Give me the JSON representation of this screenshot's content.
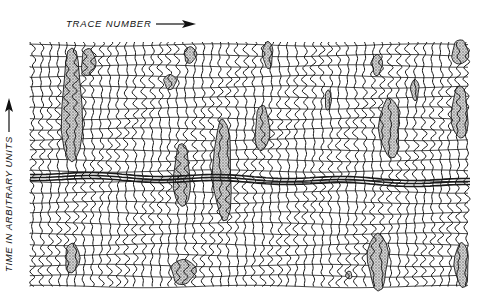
{
  "figure": {
    "x_axis_label": "TRACE NUMBER",
    "y_axis_label": "TIME IN ARBITRARY UNITS",
    "x_arrow_icon": "arrow-right",
    "y_arrow_icon": "arrow-up",
    "ink_color": "#1a1a1a",
    "stipple_color": "#8a8a8a",
    "background": "#ffffff"
  },
  "plot_area": {
    "x0": 30,
    "y0": 42,
    "x1": 471,
    "y1": 287
  },
  "traces": {
    "count": 52,
    "spacing": 8.5
  },
  "horizontal_lines": {
    "spacing": 10.5
  },
  "strong_reflector": {
    "y_start_left": 173,
    "y_end_right": 180
  },
  "anomalies": [
    {
      "cx": 72,
      "cy": 105,
      "rx": 10,
      "ry": 62
    },
    {
      "cx": 88,
      "cy": 62,
      "rx": 7,
      "ry": 14
    },
    {
      "cx": 190,
      "cy": 55,
      "rx": 6,
      "ry": 8
    },
    {
      "cx": 170,
      "cy": 82,
      "rx": 6,
      "ry": 7
    },
    {
      "cx": 268,
      "cy": 55,
      "rx": 5,
      "ry": 13
    },
    {
      "cx": 223,
      "cy": 170,
      "rx": 9,
      "ry": 52
    },
    {
      "cx": 182,
      "cy": 175,
      "rx": 8,
      "ry": 34
    },
    {
      "cx": 262,
      "cy": 128,
      "rx": 7,
      "ry": 24
    },
    {
      "cx": 328,
      "cy": 100,
      "rx": 3,
      "ry": 10
    },
    {
      "cx": 377,
      "cy": 65,
      "rx": 5,
      "ry": 10
    },
    {
      "cx": 415,
      "cy": 90,
      "rx": 4,
      "ry": 10
    },
    {
      "cx": 390,
      "cy": 128,
      "rx": 10,
      "ry": 30
    },
    {
      "cx": 460,
      "cy": 112,
      "rx": 8,
      "ry": 28
    },
    {
      "cx": 460,
      "cy": 52,
      "rx": 8,
      "ry": 13
    },
    {
      "cx": 72,
      "cy": 258,
      "rx": 7,
      "ry": 15
    },
    {
      "cx": 183,
      "cy": 272,
      "rx": 12,
      "ry": 12
    },
    {
      "cx": 378,
      "cy": 262,
      "rx": 10,
      "ry": 27
    },
    {
      "cx": 462,
      "cy": 265,
      "rx": 7,
      "ry": 22
    },
    {
      "cx": 349,
      "cy": 275,
      "rx": 3,
      "ry": 4
    }
  ]
}
